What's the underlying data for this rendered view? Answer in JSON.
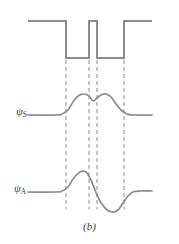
{
  "figure": {
    "caption": "(b)",
    "stroke_color": "#8c8c8c",
    "dash_color": "#8c8c8c",
    "text_color": "#3a3a3a",
    "background": "#ffffff",
    "width": 179,
    "height": 244
  },
  "labels": {
    "psi_symmetric": "ψ",
    "psi_symmetric_sub": "S",
    "psi_antisymmetric": "ψ",
    "psi_antisymmetric_sub": "A"
  },
  "chart_data": {
    "type": "line",
    "title": "",
    "subtitle": "",
    "xlabel": "",
    "ylabel": "",
    "grid": false,
    "legend": "none",
    "annotations": [
      "(b)"
    ],
    "xlim": [
      0,
      179
    ],
    "ylim": [
      0,
      244
    ],
    "guide_lines_x": [
      66,
      89,
      97,
      124
    ],
    "series": [
      {
        "name": "potential",
        "type": "step",
        "stroke": "#8c8c8c",
        "points": [
          [
            28,
            21
          ],
          [
            66,
            21
          ],
          [
            66,
            58
          ],
          [
            89,
            58
          ],
          [
            89,
            21
          ],
          [
            97,
            21
          ],
          [
            97,
            58
          ],
          [
            124,
            58
          ],
          [
            124,
            21
          ],
          [
            152,
            21
          ]
        ]
      },
      {
        "name": "psi_symmetric",
        "type": "curve",
        "stroke": "#8c8c8c",
        "baseline_y": 115,
        "peak_left": [
          78,
          96
        ],
        "dip_center": [
          93,
          101
        ],
        "peak_right": [
          108,
          96
        ],
        "points": [
          [
            28,
            115
          ],
          [
            56,
            115
          ],
          [
            62,
            114
          ],
          [
            68,
            110
          ],
          [
            73,
            102
          ],
          [
            78,
            96
          ],
          [
            84,
            94
          ],
          [
            89,
            96
          ],
          [
            93,
            101
          ],
          [
            97,
            98
          ],
          [
            101,
            95
          ],
          [
            106,
            94
          ],
          [
            111,
            97
          ],
          [
            116,
            104
          ],
          [
            121,
            110
          ],
          [
            127,
            114
          ],
          [
            133,
            115
          ],
          [
            152,
            115
          ]
        ]
      },
      {
        "name": "psi_antisymmetric",
        "type": "curve",
        "stroke": "#8c8c8c",
        "baseline_y": 192,
        "peak": [
          80,
          172
        ],
        "trough": [
          112,
          212
        ],
        "zero_crossing_x": 93,
        "points": [
          [
            28,
            192
          ],
          [
            56,
            192
          ],
          [
            62,
            191
          ],
          [
            68,
            187
          ],
          [
            73,
            179
          ],
          [
            80,
            172
          ],
          [
            86,
            172
          ],
          [
            91,
            180
          ],
          [
            95,
            190
          ],
          [
            100,
            201
          ],
          [
            106,
            209
          ],
          [
            112,
            212
          ],
          [
            118,
            210
          ],
          [
            123,
            203
          ],
          [
            128,
            196
          ],
          [
            133,
            192
          ],
          [
            140,
            191
          ],
          [
            152,
            191
          ]
        ]
      }
    ]
  }
}
